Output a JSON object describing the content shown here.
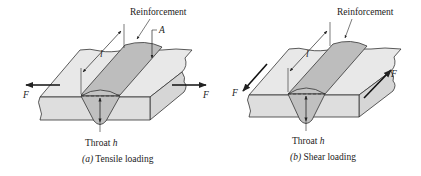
{
  "figures": [
    {
      "id": "a",
      "caption_prefix": "(a)",
      "caption_text": " Tensile loading",
      "labels": {
        "reinforcement": "Reinforcement",
        "area": "A",
        "length": "l",
        "force_left": "F",
        "force_right": "F",
        "throat": "Throat ",
        "throat_var": "h"
      }
    },
    {
      "id": "b",
      "caption_prefix": "(b)",
      "caption_text": " Shear loading",
      "labels": {
        "reinforcement": "Reinforcement",
        "length": "l",
        "force_left": "F",
        "force_right": "F",
        "throat": "Throat ",
        "throat_var": "h"
      }
    }
  ],
  "colors": {
    "plate_top": "#e8e8e8",
    "plate_front": "#dedede",
    "weld": "#b9b9b9",
    "weld_cap": "#c9c9c9",
    "stroke": "#333333"
  }
}
